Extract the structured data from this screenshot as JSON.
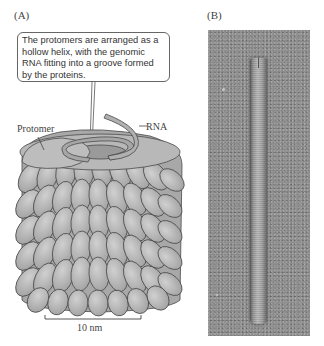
{
  "figure": {
    "panel_a": {
      "label": "(A)",
      "callout_text": "The protomers are arranged as a hollow helix, with the genomic RNA fitting into a groove formed by the proteins.",
      "labels": {
        "protomer": "Protomer",
        "rna": "RNA"
      },
      "scale_bar": {
        "label": "10 nm"
      },
      "colors": {
        "protomer_fill": "#b5b5b5",
        "protomer_stroke": "#4a4a4a",
        "rna_fill": "#a0a0a0"
      }
    },
    "panel_b": {
      "label": "(B)",
      "description": "electron micrograph of rod-shaped virus",
      "colors": {
        "background": "#8f8f8f",
        "rod": "#b0b0b0"
      }
    }
  }
}
